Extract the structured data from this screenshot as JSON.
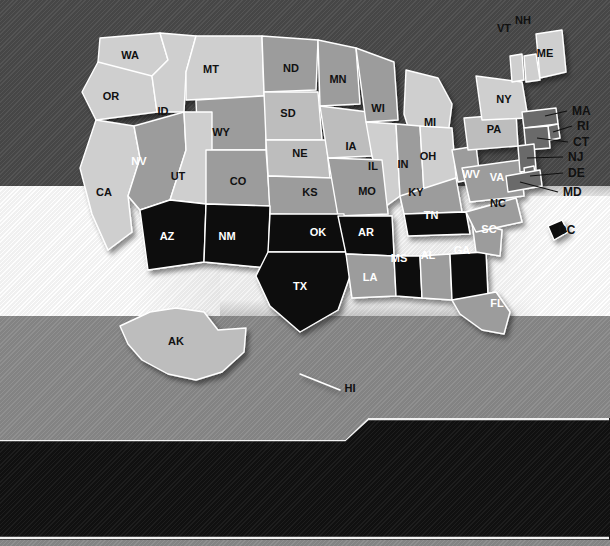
{
  "map": {
    "title": "United States rate map by state",
    "palette": {
      "highest": "#0d0d0d",
      "higher": "#6b6b6b",
      "not_different": "#9c9c9c",
      "lower": "#cfcfcf",
      "lowest": "#bdbdbd",
      "border": "#ffffff",
      "bg_top": "#4a4a4a",
      "bg_white": "#f4f4f4",
      "bg_bottom": "#8a8a8a",
      "legend_bg": "#151515"
    },
    "states": [
      {
        "id": "WA",
        "label": "WA",
        "category": "lower",
        "lx": 130,
        "ly": 59,
        "light": false
      },
      {
        "id": "OR",
        "label": "OR",
        "category": "lower",
        "lx": 111,
        "ly": 100,
        "light": false
      },
      {
        "id": "ID",
        "label": "ID",
        "category": "lower",
        "lx": 163,
        "ly": 115,
        "light": false
      },
      {
        "id": "MT",
        "label": "MT",
        "category": "lower",
        "lx": 211,
        "ly": 73,
        "light": false
      },
      {
        "id": "WY",
        "label": "WY",
        "category": "not_different",
        "lx": 221,
        "ly": 136,
        "light": false
      },
      {
        "id": "ND",
        "label": "ND",
        "category": "not_different",
        "lx": 291,
        "ly": 72,
        "light": false
      },
      {
        "id": "SD",
        "label": "SD",
        "category": "lowest",
        "lx": 288,
        "ly": 117,
        "light": false
      },
      {
        "id": "NE",
        "label": "NE",
        "category": "lowest",
        "lx": 300,
        "ly": 157,
        "light": false
      },
      {
        "id": "MN",
        "label": "MN",
        "category": "not_different",
        "lx": 338,
        "ly": 83,
        "light": false
      },
      {
        "id": "IA",
        "label": "IA",
        "category": "lowest",
        "lx": 351,
        "ly": 150,
        "light": false
      },
      {
        "id": "WI",
        "label": "WI",
        "category": "not_different",
        "lx": 378,
        "ly": 112,
        "light": false
      },
      {
        "id": "MI",
        "label": "MI",
        "category": "lower",
        "lx": 430,
        "ly": 126,
        "light": false
      },
      {
        "id": "IL",
        "label": "IL",
        "category": "lower",
        "lx": 373,
        "ly": 170,
        "light": false
      },
      {
        "id": "IN",
        "label": "IN",
        "category": "not_different",
        "lx": 403,
        "ly": 168,
        "light": false
      },
      {
        "id": "OH",
        "label": "OH",
        "category": "lower",
        "lx": 428,
        "ly": 160,
        "light": false
      },
      {
        "id": "CA",
        "label": "CA",
        "category": "lower",
        "lx": 104,
        "ly": 196,
        "light": false
      },
      {
        "id": "NV",
        "label": "NV",
        "category": "not_different",
        "lx": 139,
        "ly": 165,
        "light": true
      },
      {
        "id": "UT",
        "label": "UT",
        "category": "lower",
        "lx": 178,
        "ly": 180,
        "light": false
      },
      {
        "id": "CO",
        "label": "CO",
        "category": "not_different",
        "lx": 238,
        "ly": 185,
        "light": false
      },
      {
        "id": "KS",
        "label": "KS",
        "category": "not_different",
        "lx": 310,
        "ly": 196,
        "light": false
      },
      {
        "id": "MO",
        "label": "MO",
        "category": "not_different",
        "lx": 367,
        "ly": 195,
        "light": false
      },
      {
        "id": "KY",
        "label": "KY",
        "category": "not_different",
        "lx": 416,
        "ly": 196,
        "light": false
      },
      {
        "id": "WV",
        "label": "WV",
        "category": "not_different",
        "lx": 471,
        "ly": 178,
        "light": true
      },
      {
        "id": "VA",
        "label": "VA",
        "category": "not_different",
        "lx": 497,
        "ly": 181,
        "light": true
      },
      {
        "id": "AZ",
        "label": "AZ",
        "category": "highest",
        "lx": 167,
        "ly": 240,
        "light": true
      },
      {
        "id": "NM",
        "label": "NM",
        "category": "highest",
        "lx": 227,
        "ly": 240,
        "light": true
      },
      {
        "id": "OK",
        "label": "OK",
        "category": "highest",
        "lx": 318,
        "ly": 236,
        "light": true
      },
      {
        "id": "TX",
        "label": "TX",
        "category": "highest",
        "lx": 300,
        "ly": 290,
        "light": true
      },
      {
        "id": "AR",
        "label": "AR",
        "category": "highest",
        "lx": 366,
        "ly": 236,
        "light": true
      },
      {
        "id": "LA",
        "label": "LA",
        "category": "not_different",
        "lx": 370,
        "ly": 281,
        "light": true
      },
      {
        "id": "MS",
        "label": "MS",
        "category": "highest",
        "lx": 399,
        "ly": 262,
        "light": true
      },
      {
        "id": "AL",
        "label": "AL",
        "category": "not_different",
        "lx": 428,
        "ly": 259,
        "light": true
      },
      {
        "id": "TN",
        "label": "TN",
        "category": "highest",
        "lx": 431,
        "ly": 219,
        "light": true
      },
      {
        "id": "GA",
        "label": "GA",
        "category": "highest",
        "lx": 462,
        "ly": 254,
        "light": true
      },
      {
        "id": "SC",
        "label": "SC",
        "category": "not_different",
        "lx": 489,
        "ly": 233,
        "light": true
      },
      {
        "id": "NC",
        "label": "NC",
        "category": "not_different",
        "lx": 498,
        "ly": 207,
        "light": false
      },
      {
        "id": "FL",
        "label": "FL",
        "category": "not_different",
        "lx": 497,
        "ly": 307,
        "light": true
      },
      {
        "id": "PA",
        "label": "PA",
        "category": "lowest",
        "lx": 494,
        "ly": 133,
        "light": false
      },
      {
        "id": "NY",
        "label": "NY",
        "category": "lower",
        "lx": 504,
        "ly": 103,
        "light": false
      },
      {
        "id": "ME",
        "label": "ME",
        "category": "lower",
        "lx": 545,
        "ly": 57,
        "light": false
      },
      {
        "id": "VT",
        "label": "VT",
        "category": "lower",
        "lx": 504,
        "ly": 32,
        "light": false
      },
      {
        "id": "NH",
        "label": "NH",
        "category": "lower",
        "lx": 523,
        "ly": 24,
        "light": false
      },
      {
        "id": "AK",
        "label": "AK",
        "category": "lowest",
        "lx": 176,
        "ly": 345,
        "light": false
      },
      {
        "id": "HI",
        "label": "HI",
        "category": "lower",
        "lx": 350,
        "ly": 392,
        "light": false
      }
    ],
    "callouts": [
      {
        "id": "MA",
        "label": "MA",
        "category": "higher",
        "tx": 572,
        "ty": 115
      },
      {
        "id": "RI",
        "label": "RI",
        "category": "higher",
        "tx": 577,
        "ty": 130
      },
      {
        "id": "CT",
        "label": "CT",
        "category": "higher",
        "tx": 573,
        "ty": 146
      },
      {
        "id": "NJ",
        "label": "NJ",
        "category": "higher",
        "tx": 568,
        "ty": 161
      },
      {
        "id": "DE",
        "label": "DE",
        "category": "higher",
        "tx": 568,
        "ty": 177
      },
      {
        "id": "MD",
        "label": "MD",
        "category": "higher",
        "tx": 563,
        "ty": 196
      },
      {
        "id": "DC",
        "label": "DC",
        "category": "highest",
        "tx": 558,
        "ty": 234
      }
    ]
  },
  "legend": {
    "left_items": [
      {
        "swatch": "highest",
        "label": "10 highest rates"
      },
      {
        "swatch": "higher",
        "label": "Rates significantly\nhigher than U.S. rate"
      }
    ],
    "right_items": [
      {
        "swatch": "not_different",
        "label": "Rates not significantly\ndifferent from U.S. rate"
      },
      {
        "swatch": "lower",
        "label": "Rates significantly\nlower than U.S. rate"
      },
      {
        "swatch": "lowest",
        "label": "10 lowest rates"
      }
    ]
  }
}
